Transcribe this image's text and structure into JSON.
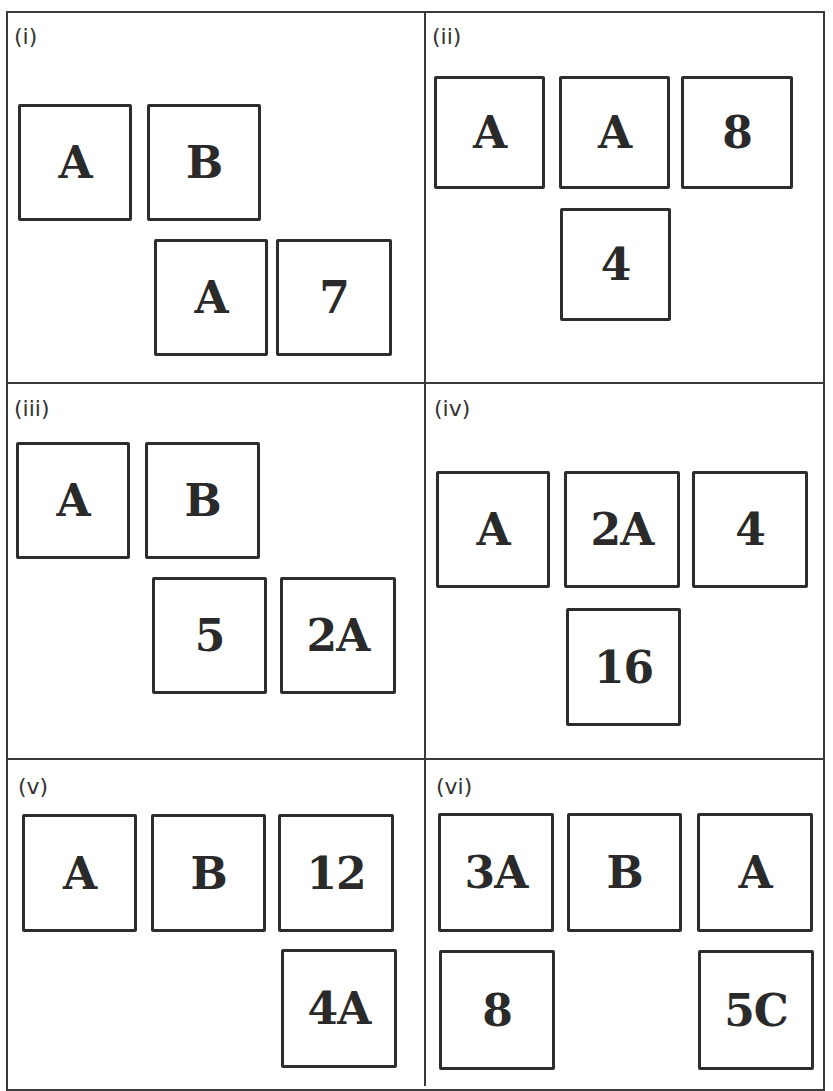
{
  "heading": {
    "clipped_text": ""
  },
  "colors": {
    "stroke": "#2d2d2d",
    "background": "#ffffff",
    "text": "#2a2a2a"
  },
  "panels": [
    {
      "label": "(i)",
      "cards": [
        "A",
        "B",
        "A",
        "7"
      ]
    },
    {
      "label": "(ii)",
      "cards": [
        "A",
        "A",
        "8",
        "4"
      ]
    },
    {
      "label": "(iii)",
      "cards": [
        "A",
        "B",
        "5",
        "2A"
      ]
    },
    {
      "label": "(iv)",
      "cards": [
        "A",
        "2A",
        "4",
        "16"
      ]
    },
    {
      "label": "(v)",
      "cards": [
        "A",
        "B",
        "12",
        "4A"
      ]
    },
    {
      "label": "(vi)",
      "cards": [
        "3A",
        "B",
        "A",
        "8",
        "5C"
      ]
    }
  ]
}
